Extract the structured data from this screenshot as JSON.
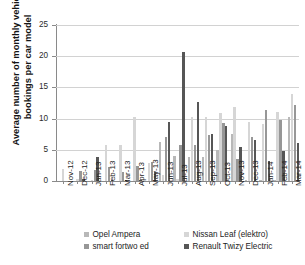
{
  "chart_data": {
    "type": "bar",
    "title": "",
    "xlabel": "",
    "ylabel": "Average number of monthly vehicle bookings per car model",
    "ylim": [
      0,
      25
    ],
    "yticks": [
      0,
      5,
      10,
      15,
      20,
      25
    ],
    "grid": true,
    "legend_position": "bottom",
    "categories": [
      "Nov-12",
      "Dec-12",
      "Jan-13",
      "Feb-13",
      "Mar-13",
      "Apr-13",
      "May-13",
      "Jun-13",
      "Jul-13",
      "Aug-13",
      "Sep-13",
      "Oct-13",
      "Nov-13",
      "Dec-13",
      "Jan-14",
      "Feb-14",
      "Mar-14"
    ],
    "series": [
      {
        "name": "Opel Ampera",
        "color": "#b8b8b8",
        "values": [
          0,
          0,
          0,
          0,
          0,
          0,
          0,
          6.2,
          4.0,
          3.8,
          3.8,
          5.0,
          7.5,
          0.2,
          0.1,
          0.1,
          10.2
        ]
      },
      {
        "name": "Nissan Leaf (elektro)",
        "color": "#d6d6d6",
        "values": [
          1.9,
          0.3,
          0.2,
          5.8,
          5.7,
          10.2,
          2.9,
          1.0,
          0.3,
          10.3,
          10.2,
          10.9,
          11.8,
          9.4,
          9.2,
          11.0,
          13.9
        ]
      },
      {
        "name": "smart fortwo ed",
        "color": "#979797",
        "values": [
          0,
          1.6,
          1.8,
          2.2,
          1.4,
          2.4,
          3.0,
          7.0,
          5.7,
          5.7,
          7.4,
          9.3,
          3.5,
          7.0,
          11.4,
          9.7,
          12.2
        ]
      },
      {
        "name": "Renault Twizy Electric",
        "color": "#565656",
        "values": [
          0,
          0.3,
          3.9,
          0.1,
          0.2,
          0.1,
          1.4,
          9.5,
          20.7,
          12.6,
          7.5,
          8.8,
          5.5,
          6.5,
          3.2,
          4.8,
          6.1
        ]
      }
    ]
  },
  "legend": {
    "items": [
      "Opel Ampera",
      "Nissan Leaf (elektro)",
      "smart fortwo ed",
      "Renault Twizy Electric"
    ]
  }
}
